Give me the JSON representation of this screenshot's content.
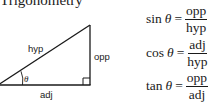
{
  "title": "Trigonometry",
  "triangle": {
    "labels": {
      "hypotenuse": "hyp",
      "opposite": "opp",
      "adjacent": "adj",
      "angle": "θ"
    },
    "right_angle_marker": true,
    "line_color": "#1a1a1a"
  },
  "formulas": [
    {
      "function": "sin",
      "variable": "θ",
      "equals": "=",
      "numerator": "opp",
      "denominator": "hyp"
    },
    {
      "function": "cos",
      "variable": "θ",
      "equals": "=",
      "numerator": "adj",
      "denominator": "hyp"
    },
    {
      "function": "tan",
      "variable": "θ",
      "equals": "=",
      "numerator": "opp",
      "denominator": "adj"
    }
  ]
}
